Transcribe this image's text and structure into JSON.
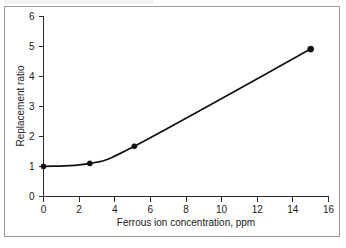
{
  "chart_data": {
    "type": "line",
    "title": "",
    "xlabel": "Ferrous ion concentration, ppm",
    "ylabel": "Replacement ratio",
    "xlim": [
      0,
      16
    ],
    "ylim": [
      0,
      6
    ],
    "xticks": [
      0,
      2,
      4,
      6,
      8,
      10,
      12,
      14,
      16
    ],
    "yticks": [
      0,
      1,
      2,
      3,
      4,
      5,
      6
    ],
    "xtick_labels": [
      "0",
      "2",
      "4",
      "6",
      "8",
      "10",
      "12",
      "14",
      "16"
    ],
    "ytick_labels": [
      "0",
      "1",
      "2",
      "3",
      "4",
      "5",
      "6"
    ],
    "grid": false,
    "legend": null,
    "series": [
      {
        "name": "Replacement ratio vs ferrous ion concentration",
        "marker": "filled-circle",
        "line_color": "#111111",
        "x": [
          0,
          2.6,
          5.1,
          15.0
        ],
        "y": [
          1.0,
          1.1,
          1.67,
          4.9
        ]
      }
    ],
    "curve_note": "smooth monotone curve: flat near 1.0 up to ~3 ppm, then rising nearly linearly",
    "axis_color": "#2b2b2b",
    "background_color": "#ffffff",
    "frame_color": "#9a9a9a"
  },
  "figure": {
    "caption": ""
  }
}
